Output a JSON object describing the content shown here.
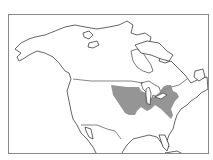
{
  "map": {
    "region": "North America",
    "type": "species range map",
    "range_color": "#8a8a8a",
    "outline_color": "#222222",
    "background_color": "#ffffff",
    "frame_color": "#888888",
    "range_area_description": "Central and eastern United States into southern Ontario"
  }
}
